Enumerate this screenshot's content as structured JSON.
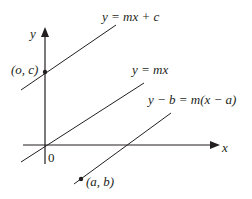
{
  "diagram": {
    "axes": {
      "x_label": "x",
      "y_label": "y",
      "origin_label": "0"
    },
    "lines": [
      {
        "id": "intercept",
        "label": "y = mx + c"
      },
      {
        "id": "through-origin",
        "label": "y = mx"
      },
      {
        "id": "point-slope",
        "label": "y − b = m(x − a)"
      }
    ],
    "points": [
      {
        "id": "y-intercept",
        "label": "(o, c)"
      },
      {
        "id": "point-ab",
        "label": "(a, b)"
      }
    ],
    "colors": {
      "ink": "#231f20",
      "background": "#ffffff"
    }
  }
}
